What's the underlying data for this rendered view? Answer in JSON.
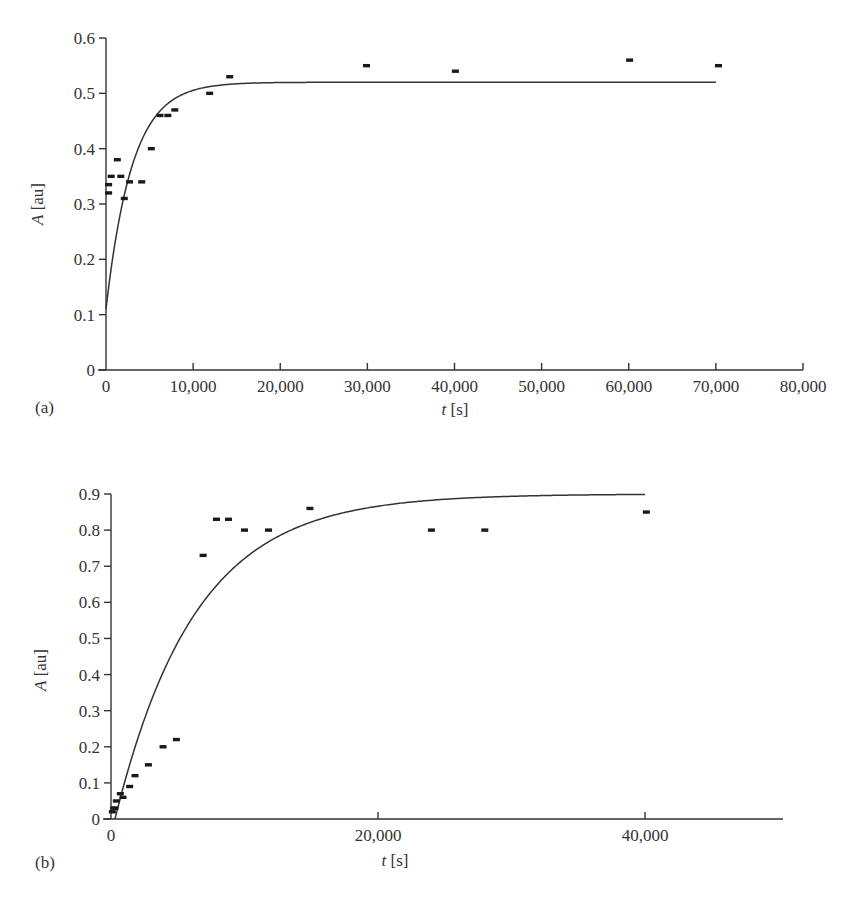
{
  "chart_data": [
    {
      "panel": "(a)",
      "type": "scatter",
      "xlabel_italic": "t",
      "xlabel_unit": "[s]",
      "ylabel_italic": "A",
      "ylabel_unit": "[au]",
      "xlim": [
        0,
        80000
      ],
      "ylim": [
        0,
        0.6
      ],
      "xticks": [
        0,
        10000,
        20000,
        30000,
        40000,
        50000,
        60000,
        70000,
        80000
      ],
      "xtick_labels": [
        "0",
        "10,000",
        "20,000",
        "30,000",
        "40,000",
        "50,000",
        "60,000",
        "70,000",
        "80,000"
      ],
      "yticks": [
        0,
        0.1,
        0.2,
        0.3,
        0.4,
        0.5,
        0.6
      ],
      "ytick_labels": [
        "0",
        "0.1",
        "0.2",
        "0.3",
        "0.4",
        "0.5",
        "0.6"
      ],
      "grid": false,
      "series": [
        {
          "name": "measured",
          "marker": "dash",
          "x": [
            300,
            300,
            600,
            1300,
            1700,
            2100,
            2700,
            4100,
            5200,
            6200,
            7100,
            7900,
            11900,
            14200,
            29900,
            40100,
            60100,
            70300
          ],
          "y": [
            0.335,
            0.32,
            0.35,
            0.38,
            0.35,
            0.31,
            0.34,
            0.34,
            0.4,
            0.46,
            0.46,
            0.47,
            0.5,
            0.53,
            0.55,
            0.54,
            0.56,
            0.55
          ]
        },
        {
          "name": "fit",
          "type": "line",
          "model": "A = 0.52 - 0.41*exp(-t/3000)",
          "params": {
            "a_inf": 0.52,
            "a_0": 0.11,
            "tau": 3000
          },
          "x_range": [
            0,
            70000
          ]
        }
      ]
    },
    {
      "panel": "(b)",
      "type": "scatter",
      "xlabel_italic": "t",
      "xlabel_unit": "[s]",
      "ylabel_italic": "A",
      "ylabel_unit": "[au]",
      "xlim": [
        0,
        50000
      ],
      "ylim": [
        0,
        0.9
      ],
      "xticks": [
        0,
        20000,
        40000
      ],
      "xtick_labels": [
        "0",
        "20,000",
        "40,000"
      ],
      "yticks": [
        0,
        0.1,
        0.2,
        0.3,
        0.4,
        0.5,
        0.6,
        0.7,
        0.8,
        0.9
      ],
      "ytick_labels": [
        "0",
        "0.1",
        "0.2",
        "0.3",
        "0.4",
        "0.5",
        "0.6",
        "0.7",
        "0.8",
        "0.9"
      ],
      "grid": false,
      "series": [
        {
          "name": "measured",
          "marker": "dash",
          "x": [
            100,
            200,
            300,
            400,
            700,
            900,
            1400,
            1800,
            2800,
            3900,
            4900,
            6900,
            7900,
            8800,
            10000,
            11800,
            14900,
            24000,
            28000,
            40100
          ],
          "y": [
            0.02,
            0.03,
            0.03,
            0.05,
            0.07,
            0.06,
            0.09,
            0.12,
            0.15,
            0.2,
            0.22,
            0.73,
            0.83,
            0.83,
            0.8,
            0.8,
            0.86,
            0.8,
            0.8,
            0.85
          ]
        },
        {
          "name": "fit",
          "type": "line",
          "model": "A = 0.9*(1 - exp(-(t-300)/6000))",
          "params": {
            "a_inf": 0.9,
            "t0": 300,
            "tau": 6000
          },
          "x_range": [
            300,
            40000
          ]
        }
      ]
    }
  ],
  "labels": {
    "panel_a": "(a)",
    "panel_b": "(b)",
    "t_symbol": "t",
    "t_unit": " [s]",
    "a_symbol": "A",
    "a_unit": " [au]"
  }
}
